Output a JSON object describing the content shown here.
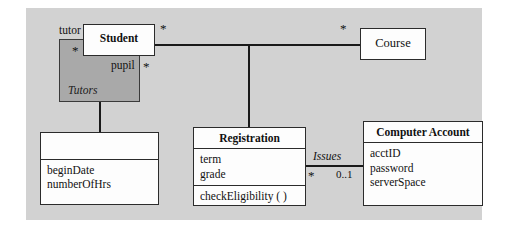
{
  "diagram": {
    "type": "uml-class-diagram",
    "background_color": "#ffffff",
    "panel_color": "#d2d2d2",
    "association_box_color": "#a9a9a9",
    "class_fill_color": "#fdfdfd",
    "line_color": "#1a1a1a"
  },
  "classes": {
    "student": {
      "name": "Student",
      "attributes": [],
      "operations": []
    },
    "course": {
      "name": "Course",
      "attributes": [],
      "operations": []
    },
    "anonymous": {
      "name": "",
      "attributes": [
        "beginDate",
        "numberOfHrs"
      ],
      "operations": []
    },
    "registration": {
      "name": "Registration",
      "attributes": [
        "term",
        "grade"
      ],
      "operations": [
        "checkEligibility ( )"
      ]
    },
    "computer_account": {
      "name": "Computer Account",
      "attributes": [
        "acctID",
        "password",
        "serverSpace"
      ],
      "operations": []
    }
  },
  "association_classes": {
    "tutors": {
      "name": "Tutors"
    }
  },
  "association_labels": {
    "issues": "Issues"
  },
  "roles": {
    "tutor": "tutor",
    "pupil": "pupil"
  },
  "multiplicities": {
    "tutor_star": "*",
    "pupil_star": "*",
    "student_course_left": "*",
    "student_course_right": "*",
    "registration_side": "*",
    "account_side": "0..1"
  }
}
